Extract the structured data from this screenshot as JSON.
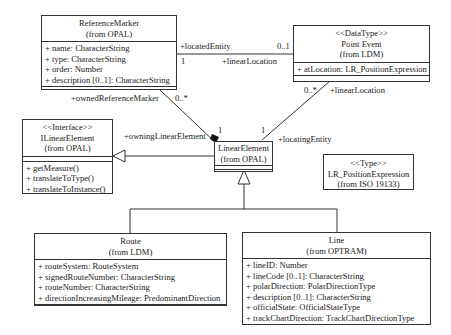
{
  "classes": {
    "reference_marker": {
      "name": "ReferenceMarker",
      "package": "(from OPAL)",
      "attributes": [
        "+ name: CharacterString",
        "+ type: CharacterString",
        "+ order: Number",
        "+ description [0..1]: CharacterString"
      ]
    },
    "point_event": {
      "stereotype": "<<DataType>>",
      "name": "Point Event",
      "package": "(from LDM)",
      "attributes": [
        "+ atLocation: LR_PositionExpression"
      ]
    },
    "ilinear_element": {
      "stereotype": "<<Interface>>",
      "name": "ILinearElement",
      "package": "(from OPAL)",
      "operations": [
        "+ getMeasure()",
        "+ translateToType()",
        "+ translateToInstance()"
      ]
    },
    "linear_element": {
      "name": "LinearElement",
      "package": "(from OPAL)"
    },
    "lr_position_expression": {
      "stereotype": "<<Type>>",
      "name": "LR_PositionExpression",
      "package": "(from ISO 19133)"
    },
    "route": {
      "name": "Route",
      "package": "(from LDM)",
      "attributes": [
        "+ routeSystem: RouteSystem",
        "+ signedRouteNumber: CharacterString",
        "+ routeNumber: CharacterString",
        "+ directionIncreasingMileage: PredominantDirection"
      ]
    },
    "line": {
      "name": "Line",
      "package": "(from OPTRAM)",
      "attributes": [
        "+ lineID: Number",
        "+ lineCode [0..1]: CharacterString",
        "+ polarDirection: PolarDirectionType",
        "+ description [0..1]: CharacterString",
        "+ officialState: OfficialStateType",
        "+ trackChartDirection: TrackChartDirectionType"
      ]
    }
  },
  "associations": {
    "located_entity": "+locatedEntity",
    "located_entity_mult": "1",
    "linear_location_top": "+linearLocation",
    "linear_location_top_mult": "0..1",
    "owned_reference_marker": "+ownedReferenceMarker",
    "owned_reference_marker_mult": "0..*",
    "linear_location_right": "+linearLocation",
    "linear_location_right_mult": "0..*",
    "owning_linear_element": "+owningLinearElement",
    "owning_linear_element_mult": "1",
    "locating_entity": "+locatingEntity",
    "locating_entity_mult": "1"
  }
}
